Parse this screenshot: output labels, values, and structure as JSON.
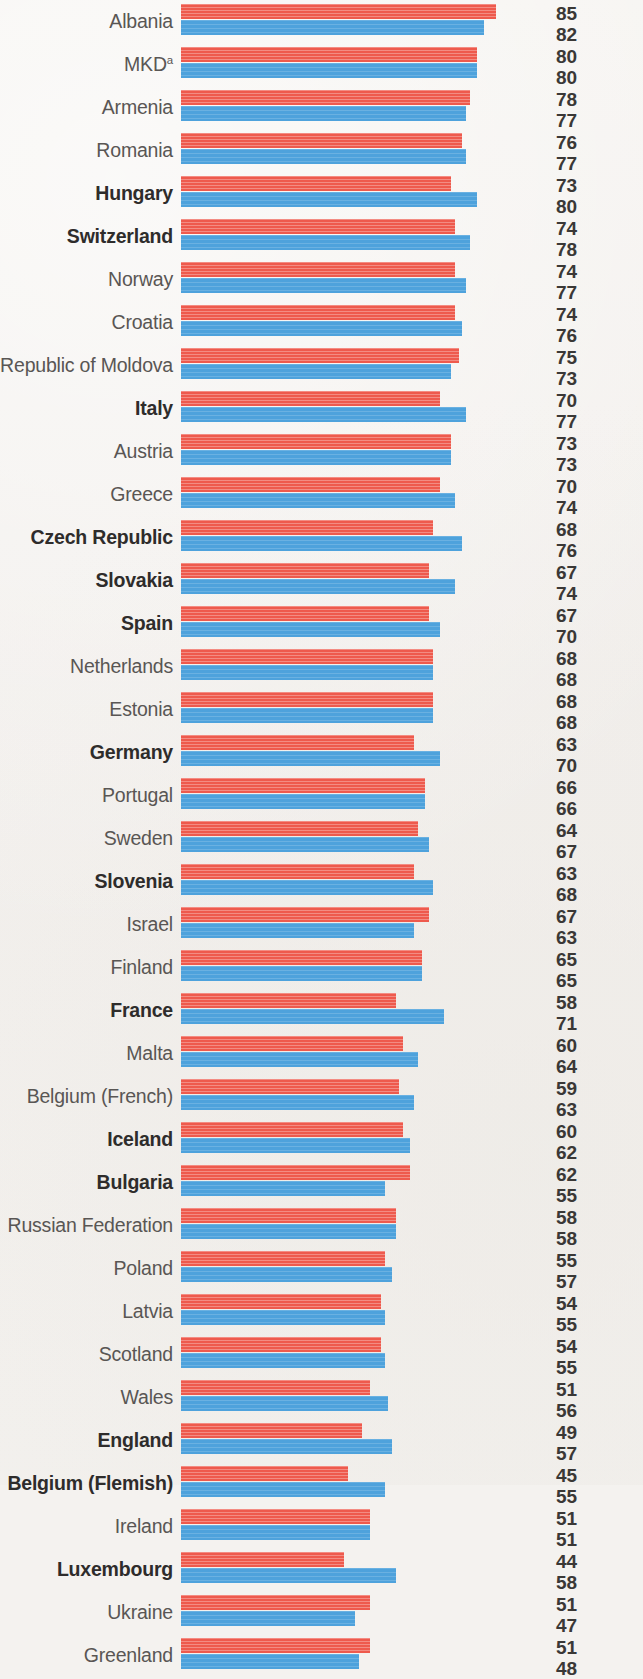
{
  "chart_data": {
    "type": "bar",
    "orientation": "horizontal",
    "title": "",
    "subtitle": "",
    "xlabel": "",
    "ylabel": "",
    "grid": false,
    "legend_position": "none",
    "xlim": [
      0,
      100
    ],
    "value_axis_max": 100,
    "bar_start_x_px": 181,
    "px_per_unit": 3.7,
    "series": [
      {
        "name": "boys",
        "color": "#ee5a4d",
        "values": [
          85,
          80,
          78,
          76,
          73,
          74,
          74,
          74,
          75,
          70,
          73,
          70,
          68,
          67,
          67,
          68,
          68,
          63,
          66,
          64,
          63,
          67,
          65,
          58,
          60,
          59,
          60,
          62,
          58,
          55,
          54,
          54,
          51,
          49,
          45,
          51,
          44,
          51,
          51
        ]
      },
      {
        "name": "girls",
        "color": "#4ea2dc",
        "values": [
          82,
          80,
          77,
          77,
          80,
          78,
          77,
          76,
          73,
          77,
          73,
          74,
          76,
          74,
          70,
          68,
          68,
          70,
          66,
          67,
          68,
          63,
          65,
          71,
          64,
          63,
          62,
          55,
          58,
          57,
          55,
          55,
          56,
          57,
          55,
          51,
          58,
          47,
          48
        ]
      }
    ],
    "categories": [
      "Albania",
      "MKD",
      "Armenia",
      "Romania",
      "Hungary",
      "Switzerland",
      "Norway",
      "Croatia",
      "Republic of Moldova",
      "Italy",
      "Austria",
      "Greece",
      "Czech Republic",
      "Slovakia",
      "Spain",
      "Netherlands",
      "Estonia",
      "Germany",
      "Portugal",
      "Sweden",
      "Slovenia",
      "Israel",
      "Finland",
      "France",
      "Malta",
      "Belgium (French)",
      "Iceland",
      "Bulgaria",
      "Russian Federation",
      "Poland",
      "Latvia",
      "Scotland",
      "Wales",
      "England",
      "Belgium (Flemish)",
      "Ireland",
      "Luxembourg",
      "Ukraine",
      "Greenland"
    ],
    "rows": [
      {
        "label": "Albania",
        "sup": "",
        "bold": false,
        "red": 85,
        "blue": 82
      },
      {
        "label": "MKD",
        "sup": "a",
        "bold": false,
        "red": 80,
        "blue": 80
      },
      {
        "label": "Armenia",
        "sup": "",
        "bold": false,
        "red": 78,
        "blue": 77
      },
      {
        "label": "Romania",
        "sup": "",
        "bold": false,
        "red": 76,
        "blue": 77
      },
      {
        "label": "Hungary",
        "sup": "",
        "bold": true,
        "red": 73,
        "blue": 80
      },
      {
        "label": "Switzerland",
        "sup": "",
        "bold": true,
        "red": 74,
        "blue": 78
      },
      {
        "label": "Norway",
        "sup": "",
        "bold": false,
        "red": 74,
        "blue": 77
      },
      {
        "label": "Croatia",
        "sup": "",
        "bold": false,
        "red": 74,
        "blue": 76
      },
      {
        "label": "Republic of Moldova",
        "sup": "",
        "bold": false,
        "red": 75,
        "blue": 73
      },
      {
        "label": "Italy",
        "sup": "",
        "bold": true,
        "red": 70,
        "blue": 77
      },
      {
        "label": "Austria",
        "sup": "",
        "bold": false,
        "red": 73,
        "blue": 73
      },
      {
        "label": "Greece",
        "sup": "",
        "bold": false,
        "red": 70,
        "blue": 74
      },
      {
        "label": "Czech Republic",
        "sup": "",
        "bold": true,
        "red": 68,
        "blue": 76
      },
      {
        "label": "Slovakia",
        "sup": "",
        "bold": true,
        "red": 67,
        "blue": 74
      },
      {
        "label": "Spain",
        "sup": "",
        "bold": true,
        "red": 67,
        "blue": 70
      },
      {
        "label": "Netherlands",
        "sup": "",
        "bold": false,
        "red": 68,
        "blue": 68
      },
      {
        "label": "Estonia",
        "sup": "",
        "bold": false,
        "red": 68,
        "blue": 68
      },
      {
        "label": "Germany",
        "sup": "",
        "bold": true,
        "red": 63,
        "blue": 70
      },
      {
        "label": "Portugal",
        "sup": "",
        "bold": false,
        "red": 66,
        "blue": 66
      },
      {
        "label": "Sweden",
        "sup": "",
        "bold": false,
        "red": 64,
        "blue": 67
      },
      {
        "label": "Slovenia",
        "sup": "",
        "bold": true,
        "red": 63,
        "blue": 68
      },
      {
        "label": "Israel",
        "sup": "",
        "bold": false,
        "red": 67,
        "blue": 63
      },
      {
        "label": "Finland",
        "sup": "",
        "bold": false,
        "red": 65,
        "blue": 65
      },
      {
        "label": "France",
        "sup": "",
        "bold": true,
        "red": 58,
        "blue": 71
      },
      {
        "label": "Malta",
        "sup": "",
        "bold": false,
        "red": 60,
        "blue": 64
      },
      {
        "label": "Belgium (French)",
        "sup": "",
        "bold": false,
        "red": 59,
        "blue": 63
      },
      {
        "label": "Iceland",
        "sup": "",
        "bold": true,
        "red": 60,
        "blue": 62
      },
      {
        "label": "Bulgaria",
        "sup": "",
        "bold": true,
        "red": 62,
        "blue": 55
      },
      {
        "label": "Russian Federation",
        "sup": "",
        "bold": false,
        "red": 58,
        "blue": 58
      },
      {
        "label": "Poland",
        "sup": "",
        "bold": false,
        "red": 55,
        "blue": 57
      },
      {
        "label": "Latvia",
        "sup": "",
        "bold": false,
        "red": 54,
        "blue": 55
      },
      {
        "label": "Scotland",
        "sup": "",
        "bold": false,
        "red": 54,
        "blue": 55
      },
      {
        "label": "Wales",
        "sup": "",
        "bold": false,
        "red": 51,
        "blue": 56
      },
      {
        "label": "England",
        "sup": "",
        "bold": true,
        "red": 49,
        "blue": 57
      },
      {
        "label": "Belgium (Flemish)",
        "sup": "",
        "bold": true,
        "red": 45,
        "blue": 55
      },
      {
        "label": "Ireland",
        "sup": "",
        "bold": false,
        "red": 51,
        "blue": 51
      },
      {
        "label": "Luxembourg",
        "sup": "",
        "bold": true,
        "red": 44,
        "blue": 58
      },
      {
        "label": "Ukraine",
        "sup": "",
        "bold": false,
        "red": 51,
        "blue": 47
      },
      {
        "label": "Greenland",
        "sup": "",
        "bold": false,
        "red": 51,
        "blue": 48
      }
    ]
  },
  "colors": {
    "red": "#ee5a4d",
    "blue": "#4ea2dc",
    "background": "#f4f2ef",
    "label": "#595654",
    "label_bold": "#2e2c2b",
    "value": "#3a3836"
  }
}
